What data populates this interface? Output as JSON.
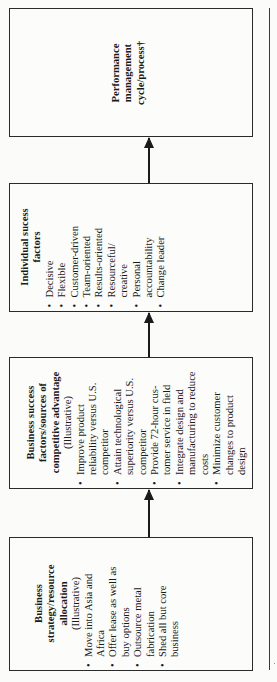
{
  "boxes": [
    {
      "id": "performance",
      "title": "Performance management cycle/process†",
      "title_lines": [
        "Performance",
        "management",
        "cycle/process†"
      ],
      "subtitle": "",
      "items": []
    },
    {
      "id": "individual",
      "title_lines": [
        "Individual sucess",
        "factors"
      ],
      "subtitle": "",
      "items": [
        "Decisive",
        "Flexible",
        "Customer-driven",
        "Team-oriented",
        "Results-oriented",
        "Resourceful/ creative",
        "Personal accountability",
        "Change leader"
      ]
    },
    {
      "id": "business-success",
      "title_lines": [
        "Business success",
        "factors/sources of",
        "competitive advantage"
      ],
      "subtitle": "(Illustrative)",
      "items": [
        "Improve product reliability versus U.S. competitor",
        "Attain technological superiority versus U.S. competitor",
        "Provide 72-hour cus- tomer service in field",
        "Integrate design and manufacturing to reduce costs",
        "Minimize customer changes to product design"
      ]
    },
    {
      "id": "business-strategy",
      "title_lines": [
        "Business",
        "strategy/resource",
        "allocation"
      ],
      "subtitle": "(Illustrative)",
      "items": [
        "Move into Asia and Africa",
        "Offer lease as well as buy options",
        "Outsource metal fabrication",
        "Shed all but core business"
      ]
    }
  ],
  "flow": [
    {
      "from": "business-strategy",
      "to": "business-success"
    },
    {
      "from": "business-success",
      "to": "individual"
    },
    {
      "from": "individual",
      "to": "performance"
    }
  ],
  "colors": {
    "line": "#1a1a1a",
    "background": "#fbfbf9"
  }
}
